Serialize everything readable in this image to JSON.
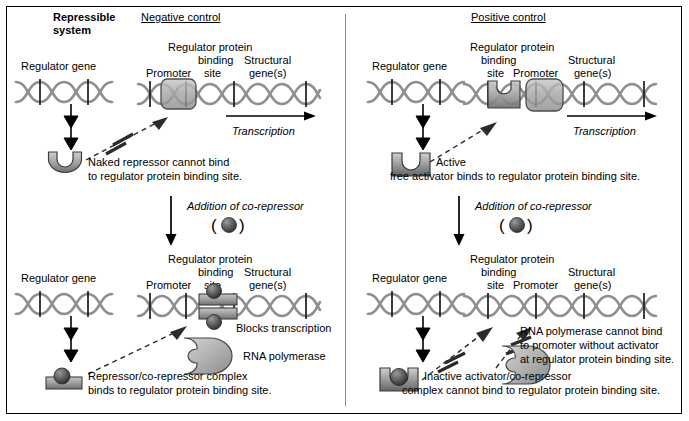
{
  "figure": {
    "system_title_line1": "Repressible",
    "system_title_line2": "system",
    "panels": [
      {
        "id": "negative",
        "heading": "Negative control",
        "top": {
          "regulator_gene_label": "Regulator gene",
          "operon_labels": {
            "regulator_protein": "Regulator protein",
            "binding": "binding",
            "site": "site",
            "promoter": "Promoter",
            "structural": "Structural",
            "genes": "gene(s)"
          },
          "transcription_label": "Transcription",
          "protein_caption_line1": "Naked repressor cannot bind",
          "protein_caption_line2": "to regulator protein binding site."
        },
        "middle": {
          "addition_label": "Addition of co-repressor",
          "corepressor_symbol": "(    )"
        },
        "bottom": {
          "regulator_gene_label": "Regulator gene",
          "operon_labels": {
            "regulator_protein": "Regulator protein",
            "binding": "binding",
            "site": "site",
            "promoter": "Promoter",
            "structural": "Structural",
            "genes": "gene(s)"
          },
          "blocks_label": "Blocks transcription",
          "polymerase_label": "RNA polymerase",
          "protein_caption_line1": "Repressor/co-repressor complex",
          "protein_caption_line2": "binds to regulator protein binding site."
        }
      },
      {
        "id": "positive",
        "heading": "Positive control",
        "top": {
          "regulator_gene_label": "Regulator gene",
          "operon_labels": {
            "regulator_protein": "Regulator protein",
            "binding": "binding",
            "site": "site",
            "promoter": "Promoter",
            "structural": "Structural",
            "genes": "gene(s)"
          },
          "transcription_label": "Transcription",
          "protein_caption_line1": "Active",
          "protein_caption_line2": "free activator binds to regulator protein binding site."
        },
        "middle": {
          "addition_label": "Addition of co-repressor",
          "corepressor_symbol": "(    )"
        },
        "bottom": {
          "regulator_gene_label": "Regulator gene",
          "operon_labels": {
            "regulator_protein": "Regulator protein",
            "binding": "binding",
            "site": "site",
            "promoter": "Promoter",
            "structural": "Structural",
            "genes": "gene(s)"
          },
          "polymerase_caption_line1": "RNA polymerase cannot bind",
          "polymerase_caption_line2": "to promoter without activator",
          "polymerase_caption_line3": "at regulator protein binding site.",
          "protein_caption_line1": "Inactive activator/co-repressor",
          "protein_caption_line2": "complex cannot bind to regulator protein binding site."
        }
      }
    ],
    "colors": {
      "ink": "#000000",
      "dna_strand": "#8f8f8f",
      "protein_light": "#d2d2d2",
      "protein_mid": "#9a9a9a",
      "protein_dark": "#4a4a4a",
      "sphere": "#4f4f4f",
      "divider": "#8a8a8a"
    }
  }
}
